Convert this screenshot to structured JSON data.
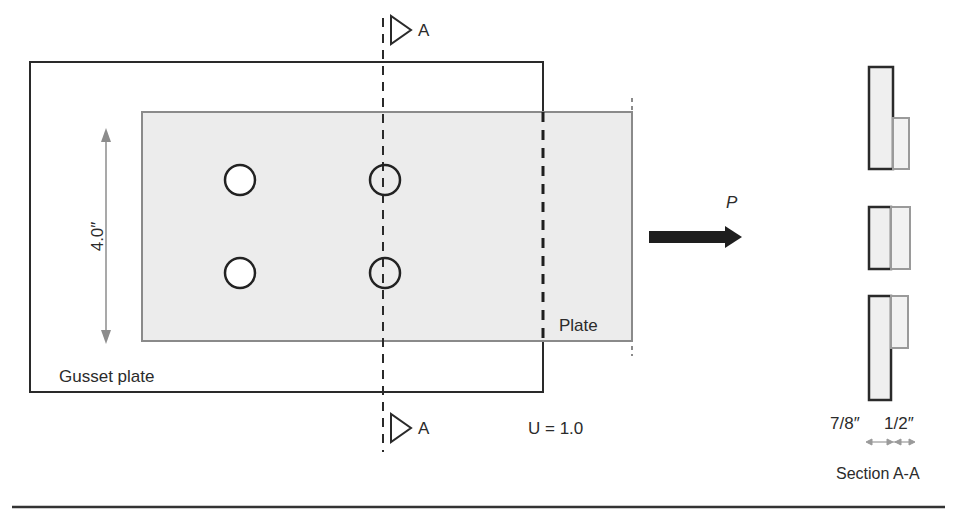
{
  "diagram": {
    "type": "bolted-connection-plan-and-section",
    "labels": {
      "gusset_plate": "Gusset plate",
      "plate": "Plate",
      "dimension_width": "4.0″",
      "section_marker_top": "A",
      "section_marker_bottom": "A",
      "load": "P",
      "shear_lag_factor": "U = 1.0",
      "section_thickness_gusset": "7/8″",
      "section_thickness_plate": "1/2″",
      "section_title": "Section A-A"
    },
    "bolts": {
      "rows": 2,
      "columns": 2,
      "count": 4
    },
    "colors": {
      "gusset_outline": "#2a2a2a",
      "plate_fill": "#ececec",
      "plate_outline": "#8a8a8a",
      "dimension_line": "#8c8c8c",
      "load_arrow": "#1e1e1e",
      "baseline": "#333333"
    }
  }
}
